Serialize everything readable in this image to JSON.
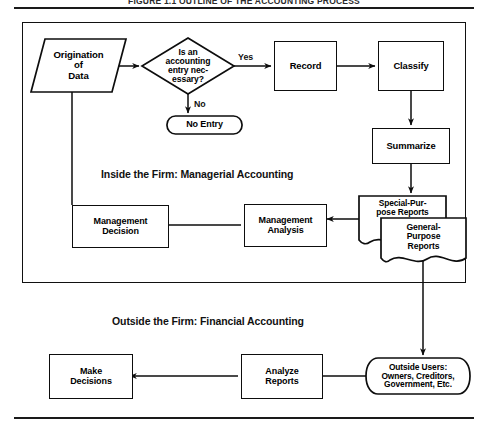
{
  "figure": {
    "title": "FIGURE 1.1  OUTLINE OF THE ACCOUNTING PROCESS",
    "width": 488,
    "height": 429,
    "line_color": "#0d0d0d",
    "background": "#ffffff"
  },
  "sections": {
    "inside": "Inside the Firm: Managerial Accounting",
    "outside": "Outside the Firm: Financial Accounting"
  },
  "edge_labels": {
    "yes": "Yes",
    "no": "No"
  },
  "nodes": {
    "origination": "Origination\nof\nData",
    "decision": "Is an\naccounting\nentry nec-\nessary?",
    "no_entry": "No Entry",
    "record": "Record",
    "classify": "Classify",
    "summarize": "Summarize",
    "special_reports": "Special-Pur-\npose Reports",
    "general_reports": "General-\nPurpose\nReports",
    "mgmt_analysis": "Management\nAnalysis",
    "mgmt_decision": "Management\nDecision",
    "outside_users": "Outside Users:\nOwners, Creditors,\nGovernment, Etc.",
    "analyze_reports": "Analyze\nReports",
    "make_decisions": "Make\nDecisions"
  }
}
